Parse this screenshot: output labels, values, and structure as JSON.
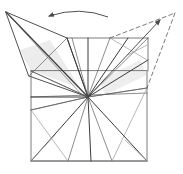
{
  "diagram": {
    "type": "origami-fold-diagram",
    "background": "#ffffff",
    "colors": {
      "line": "#5a5a5a",
      "line_dark": "#3c3c3c",
      "line_light": "#9a9a9a",
      "shade": "#c8c8c8"
    },
    "center": [
      88,
      97
    ],
    "square_outline": [
      [
        31,
        71
      ],
      [
        31,
        161
      ],
      [
        147,
        161
      ],
      [
        147,
        71
      ]
    ],
    "top_inner_edge": [
      [
        67,
        38
      ],
      [
        148,
        38
      ]
    ],
    "left_flap": {
      "tip": [
        6,
        12
      ],
      "points": [
        [
          6,
          12
        ],
        [
          67,
          38
        ],
        [
          88,
          97
        ],
        [
          29,
          76
        ]
      ],
      "crease_to_center": [
        [
          6,
          12
        ],
        [
          88,
          97
        ]
      ],
      "cross_fold": [
        [
          29,
          76
        ],
        [
          67,
          38
        ]
      ]
    },
    "right_dashed_flap": {
      "tip": [
        175,
        13
      ],
      "points": [
        [
          110,
          38
        ],
        [
          175,
          13
        ],
        [
          147,
          88
        ]
      ]
    },
    "horizontals": [
      [
        [
          31,
          71
        ],
        [
          88,
          97
        ]
      ],
      [
        [
          31,
          110
        ],
        [
          88,
          97
        ]
      ],
      [
        [
          88,
          97
        ],
        [
          147,
          88
        ]
      ],
      [
        [
          31,
          161
        ],
        [
          147,
          161
        ]
      ],
      [
        [
          31,
          97
        ],
        [
          147,
          93
        ]
      ]
    ],
    "rays_from_center": [
      [
        67,
        38
      ],
      [
        72,
        38
      ],
      [
        88,
        38
      ],
      [
        110,
        38
      ],
      [
        128,
        38
      ],
      [
        148,
        38
      ],
      [
        148,
        60
      ],
      [
        147,
        88
      ],
      [
        147,
        161
      ],
      [
        112,
        161
      ],
      [
        91,
        161
      ],
      [
        68,
        161
      ],
      [
        31,
        161
      ],
      [
        31,
        110
      ],
      [
        31,
        97
      ],
      [
        31,
        71
      ]
    ],
    "bottom_folds": [
      [
        [
          31,
          110
        ],
        [
          68,
          161
        ]
      ],
      [
        [
          31,
          161
        ],
        [
          55,
          135
        ]
      ],
      [
        [
          147,
          88
        ],
        [
          112,
          161
        ]
      ],
      [
        [
          147,
          161
        ],
        [
          125,
          140
        ]
      ]
    ],
    "right_inner_folds": [
      [
        [
          110,
          38
        ],
        [
          147,
          60
        ]
      ],
      [
        [
          128,
          55
        ],
        [
          147,
          45
        ]
      ]
    ],
    "arrows": [
      {
        "name": "rotate-arrow",
        "path": "M108,17 Q80,6 49,16",
        "head": [
          49,
          16
        ]
      },
      {
        "name": "fold-arrow",
        "path": "M88,97 L160,20",
        "head": [
          160,
          20
        ]
      }
    ]
  }
}
